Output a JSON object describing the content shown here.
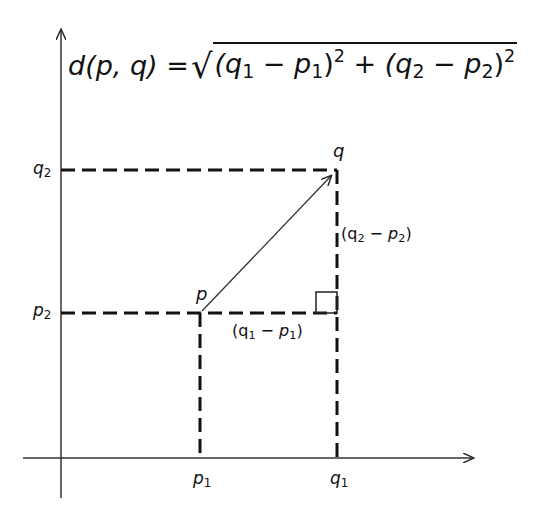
{
  "diagram": {
    "title_formula": {
      "lhs": "d(p, q)",
      "equals": "=",
      "sqrt_symbol": "√",
      "term1_open": "(q",
      "term1_q_sub": "1",
      "term1_minus": " − p",
      "term1_p_sub": "1",
      "term1_close": ")",
      "term1_exp": "2",
      "plus": " + ",
      "term2_open": "(q",
      "term2_q_sub": "2",
      "term2_minus": " − p",
      "term2_p_sub": "2",
      "term2_close": ")",
      "term2_exp": "2"
    },
    "axes": {
      "y_axis_labels": [
        {
          "base": "q",
          "sub": "2"
        },
        {
          "base": "p",
          "sub": "2"
        }
      ],
      "x_axis_labels": [
        {
          "base": "p",
          "sub": "1"
        },
        {
          "base": "q",
          "sub": "1"
        }
      ]
    },
    "points": {
      "p": {
        "label": "p"
      },
      "q": {
        "label": "q"
      }
    },
    "differences": {
      "horizontal": {
        "open": "(q",
        "q_sub": "1",
        "minus": " − p",
        "p_sub": "1",
        "close": ")"
      },
      "vertical": {
        "open": "(q",
        "q_sub": "2",
        "minus": " − p",
        "p_sub": "2",
        "close": ")"
      }
    },
    "right_angle_marker": "square",
    "colors": {
      "ink": "#111111",
      "background": "#ffffff"
    }
  }
}
